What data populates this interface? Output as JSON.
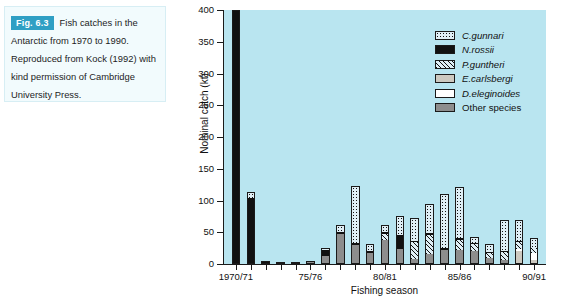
{
  "caption": {
    "fig_tag": "Fig. 6.3",
    "text": "Fish catches in the Antarctic from 1970 to 1990. Reproduced from Kock (1992) with kind permission of Cambridge University Press."
  },
  "chart_data": {
    "type": "bar",
    "subtype": "stacked-bar",
    "title": "",
    "xlabel": "Fishing season",
    "ylabel": "Nominal catch (kt)",
    "ylim": [
      0,
      400
    ],
    "yticks": [
      0,
      50,
      100,
      150,
      200,
      250,
      300,
      350,
      400
    ],
    "ytick_labels": [
      "0",
      "50",
      "100",
      "150",
      "200",
      "250",
      "300",
      "350",
      "400"
    ],
    "grid": false,
    "legend_position": "upper-right-inside",
    "plot_background": "#b9e5f0",
    "xtick_labels": [
      "1970/71",
      "75/76",
      "80/81",
      "85/86",
      "90/91"
    ],
    "xtick_indices": [
      0,
      5,
      10,
      15,
      20
    ],
    "categories": [
      "1970/71",
      "1971/72",
      "1972/73",
      "1973/74",
      "1974/75",
      "1975/76",
      "1976/77",
      "1977/78",
      "1978/79",
      "1979/80",
      "1980/81",
      "1981/82",
      "1982/83",
      "1983/84",
      "1984/85",
      "1985/86",
      "1986/87",
      "1987/88",
      "1988/89",
      "1989/90",
      "1990/91"
    ],
    "series": [
      {
        "name": "C.gunnari",
        "pattern": "dotted",
        "color": "#dfeef5",
        "values": [
          0,
          9,
          0,
          0,
          0,
          0,
          4,
          10,
          90,
          10,
          10,
          30,
          35,
          45,
          85,
          80,
          9,
          12,
          48,
          32,
          15
        ]
      },
      {
        "name": "N.rossii",
        "pattern": "solid-black",
        "color": "#111111",
        "values": [
          400,
          104,
          3,
          1,
          1,
          2,
          9,
          3,
          3,
          4,
          3,
          22,
          3,
          3,
          3,
          3,
          2,
          2,
          2,
          2,
          1
        ]
      },
      {
        "name": "P.guntheri",
        "pattern": "diagonal-hatch",
        "color": "#dfeef5",
        "values": [
          0,
          0,
          0,
          0,
          0,
          0,
          0,
          0,
          0,
          0,
          10,
          0,
          26,
          30,
          0,
          16,
          11,
          8,
          12,
          12,
          8
        ]
      },
      {
        "name": "E.carlsbergi",
        "pattern": "light-gray",
        "color": "#cdc9c0",
        "values": [
          0,
          0,
          0,
          0,
          0,
          0,
          0,
          0,
          0,
          0,
          0,
          0,
          0,
          0,
          0,
          0,
          0,
          0,
          0,
          20,
          5
        ]
      },
      {
        "name": "D.eleginoides",
        "pattern": "white",
        "color": "#ffffff",
        "values": [
          0,
          0,
          0,
          0,
          0,
          0,
          0,
          0,
          0,
          0,
          0,
          0,
          0,
          0,
          0,
          0,
          0,
          0,
          0,
          3,
          10
        ]
      },
      {
        "name": "Other species",
        "pattern": "medium-gray",
        "color": "#8d8d8d",
        "values": [
          0,
          0,
          2,
          2,
          1,
          3,
          13,
          48,
          30,
          17,
          38,
          24,
          8,
          16,
          22,
          22,
          20,
          9,
          7,
          0,
          2
        ]
      }
    ],
    "totals": [
      400,
      113,
      5,
      3,
      2,
      5,
      26,
      61,
      123,
      31,
      61,
      76,
      72,
      94,
      110,
      121,
      42,
      31,
      69,
      69,
      41
    ]
  },
  "legend": {
    "items": [
      {
        "label": "C.gunnari",
        "italic": true
      },
      {
        "label": "N.rossii",
        "italic": true
      },
      {
        "label": "P.guntheri",
        "italic": true
      },
      {
        "label": "E.carlsbergi",
        "italic": true
      },
      {
        "label": "D.eleginoides",
        "italic": true
      },
      {
        "label": "Other species",
        "italic": false
      }
    ]
  }
}
